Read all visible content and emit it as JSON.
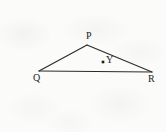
{
  "figure": {
    "kind": "geometry-diagram",
    "width": 166,
    "height": 132,
    "background_color": "#fbfbfa",
    "stroke_color": "#2b2b2b",
    "arc_color": "#8e8e8e",
    "label_color": "#1c1c1c",
    "points": [
      {
        "id": "P",
        "label": "P",
        "x": 87,
        "y": 45,
        "label_x": 86,
        "label_y": 31,
        "marker": "vertex"
      },
      {
        "id": "Q",
        "label": "Q",
        "x": 39,
        "y": 71,
        "label_x": 33,
        "label_y": 73,
        "marker": "vertex"
      },
      {
        "id": "R",
        "label": "R",
        "x": 152,
        "y": 72,
        "label_x": 148,
        "label_y": 74,
        "marker": "vertex"
      },
      {
        "id": "Y",
        "label": "Y",
        "x": 103,
        "y": 62,
        "label_x": 106,
        "label_y": 55,
        "marker": "dot"
      }
    ],
    "segments": [
      {
        "id": "QP",
        "from": "Q",
        "to": "P"
      },
      {
        "id": "PR",
        "from": "P",
        "to": "R"
      },
      {
        "id": "QR",
        "from": "Q",
        "to": "R"
      }
    ],
    "arc": {
      "id": "arc-centered-at-Q",
      "center_x": 39,
      "center_y": 70,
      "radius": 49.5,
      "start_angle_deg": 168,
      "end_angle_deg": 192,
      "note": "open arc, gap on the left side"
    }
  }
}
